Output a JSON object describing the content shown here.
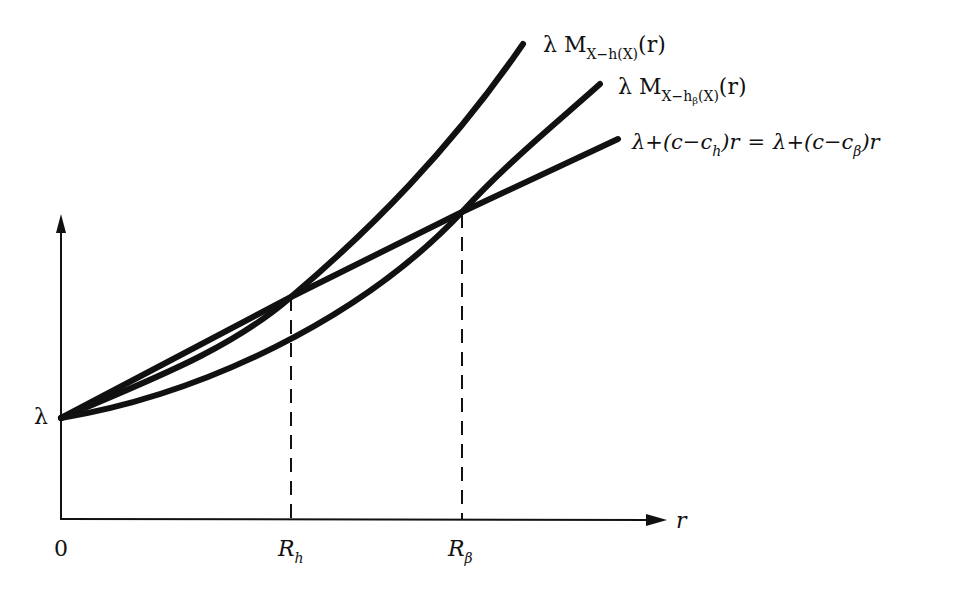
{
  "diagram": {
    "type": "function-comparison-plot",
    "axes": {
      "x_label": "r",
      "y_tick_label": "λ",
      "origin_label": "0",
      "x_ticks": [
        "R_h",
        "R_β"
      ]
    },
    "curves": [
      {
        "id": "steep",
        "label_main": "λ M",
        "label_sub": "X−h(X)",
        "label_tail": "(r)",
        "description": "λ M_{X−h(X)}(r)"
      },
      {
        "id": "medium",
        "label_main": "λ M",
        "label_sub_pre": "X−h",
        "label_sub_sub": "β",
        "label_sub_post": "(X)",
        "label_tail": "(r)",
        "description": "λ M_{X−h_β(X)}(r)"
      },
      {
        "id": "line",
        "description": "λ+(c−c_h)r = λ+(c−c_β)r",
        "left": {
          "a": "λ+(c−c",
          "sub": "h",
          "b": ")r"
        },
        "eq": "=",
        "right": {
          "a": "λ+(c−c",
          "sub": "β",
          "b": ")r"
        }
      }
    ],
    "ticks": {
      "Rh": {
        "main": "R",
        "sub": "h"
      },
      "Rb": {
        "main": "R",
        "sub": "β"
      }
    },
    "colors": {
      "stroke": "#111111",
      "background": "#ffffff"
    }
  }
}
